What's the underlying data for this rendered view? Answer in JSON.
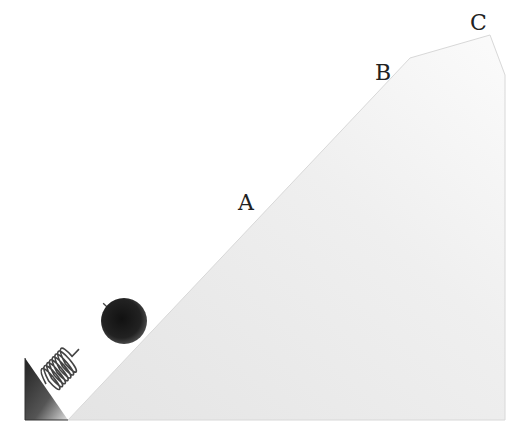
{
  "diagram": {
    "type": "spring-launched ball on inclined ramp",
    "labels": {
      "a": "A",
      "b": "B",
      "c": "C"
    },
    "colors": {
      "ramp_fill": "#ececec",
      "ramp_edge": "#dcdcdc",
      "ball": "#1e1e1e",
      "spring": "#444444",
      "wall": "#2a2a2a"
    }
  }
}
